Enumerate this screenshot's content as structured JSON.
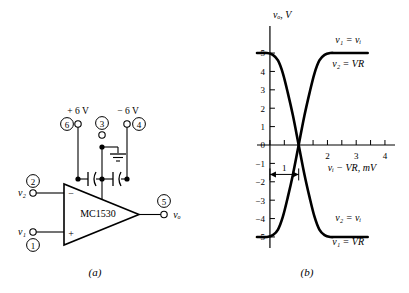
{
  "figure": {
    "panel_a": {
      "caption": "(a)",
      "chip_label": "MC1530",
      "inputs": [
        {
          "signal": "v₂",
          "pin": "2",
          "polarity": "−"
        },
        {
          "signal": "v₁",
          "pin": "1",
          "polarity": "+"
        }
      ],
      "output": {
        "signal": "vₒ",
        "pin": "5"
      },
      "supplies": [
        {
          "label": "+ 6 V",
          "pin": "6"
        },
        {
          "label": "",
          "pin": "3"
        },
        {
          "label": "− 6 V",
          "pin": "4"
        }
      ],
      "ground_symbol": "ground-icon",
      "capacitors": 2
    },
    "panel_b": {
      "caption": "(b)",
      "curve_labels": {
        "upper_top": "v₁ = vᵢ",
        "upper_bottom": "v₂ = VR",
        "lower_top": "v₂ = vᵢ",
        "lower_bottom": "v₁ = VR"
      },
      "annotation": {
        "label": "1",
        "type": "double-arrow"
      }
    }
  },
  "chart_data": {
    "type": "line",
    "title": "",
    "xlabel": "vᵢ − VR, mV",
    "ylabel": "vₒ, V",
    "xlim": [
      -0.45,
      4.35
    ],
    "ylim": [
      -5.6,
      5.6
    ],
    "xticks": [
      0,
      0.5,
      1,
      1.5,
      2,
      2.5,
      3,
      3.5,
      4
    ],
    "xticklabels": [
      "",
      "",
      "",
      "",
      "2",
      "",
      "3",
      "",
      "4"
    ],
    "yticks": [
      -5,
      -4,
      -3,
      -2,
      -1,
      0,
      1,
      2,
      3,
      4,
      5
    ],
    "yticklabels": [
      "−5",
      "−4",
      "−3",
      "−2",
      "−1",
      "0",
      "1",
      "2",
      "3",
      "4",
      "5"
    ],
    "grid": false,
    "legend": "inline-annotations",
    "series": [
      {
        "name": "v₁ = vᵢ, v₂ = VR",
        "comment": "falling-then-rising V shape: saturated +5 at left, crosses 0 at 1 mV, returns to +5",
        "x": [
          -0.45,
          -0.1,
          0.1,
          0.28,
          0.45,
          0.62,
          0.8,
          1.0,
          1.2,
          1.38,
          1.55,
          1.72,
          1.9,
          2.1,
          2.3,
          2.6,
          3.0,
          3.4
        ],
        "y": [
          5.0,
          5.0,
          4.9,
          4.6,
          3.9,
          2.85,
          1.6,
          0.0,
          -1.6,
          -2.85,
          -3.9,
          -4.6,
          -4.9,
          -5.0,
          -5.0,
          -5.0,
          -5.0,
          -5.0
        ]
      },
      {
        "name": "v₂ = vᵢ, v₁ = VR",
        "comment": "mirror image: saturated −5 at left, crosses 0 at 1 mV, returns to −5",
        "x": [
          -0.45,
          -0.1,
          0.1,
          0.28,
          0.45,
          0.62,
          0.8,
          1.0,
          1.2,
          1.38,
          1.55,
          1.72,
          1.9,
          2.1,
          2.3,
          2.6,
          3.0,
          3.4
        ],
        "y": [
          -5.0,
          -5.0,
          -4.9,
          -4.6,
          -3.9,
          -2.85,
          -1.6,
          0.0,
          1.6,
          2.85,
          3.9,
          4.6,
          4.9,
          5.0,
          5.0,
          5.0,
          5.0,
          5.0
        ]
      }
    ],
    "crossing_point": {
      "x": 1.0,
      "y": 0.0
    },
    "saturation": {
      "positive": 5.0,
      "negative": -5.0
    },
    "annotation_span": {
      "from": 0.0,
      "to": 1.0,
      "at_y": -1.6,
      "label": "1"
    }
  }
}
